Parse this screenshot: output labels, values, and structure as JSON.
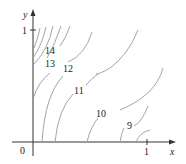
{
  "figure": {
    "type": "contour_map",
    "axes": {
      "x_label": "x",
      "y_label": "y",
      "origin_label": "0",
      "x_tick_label": "1",
      "y_tick_label": "1"
    },
    "contour_labels": [
      "14",
      "13",
      "12",
      "11",
      "10",
      "9"
    ],
    "colors": {
      "axis": "#333333",
      "contour": "#9a9a9a",
      "text": "#222222"
    }
  }
}
